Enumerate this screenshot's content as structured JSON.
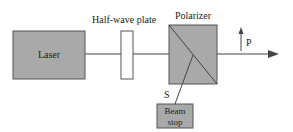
{
  "diagram": {
    "laser": {
      "label": "Laser"
    },
    "half_wave_plate": {
      "label": "Half-wave plate"
    },
    "polarizer": {
      "label": "Polarizer"
    },
    "beam_stop": {
      "label_line1": "Beam",
      "label_line2": "stop"
    },
    "p_label": "P",
    "s_label": "S",
    "colors": {
      "box_fill": "#a9a9a9",
      "line": "#444444",
      "plate_fill": "#ffffff"
    }
  }
}
